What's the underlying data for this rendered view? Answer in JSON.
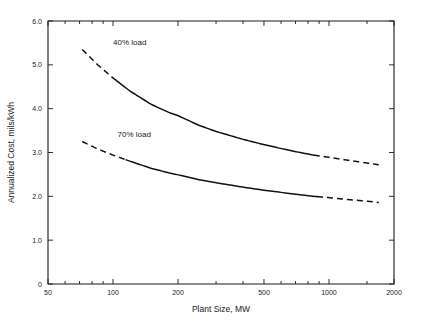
{
  "chart_data": {
    "type": "line",
    "title": "",
    "xlabel": "Plant Size, MW",
    "ylabel": "Annualized Cost, mils/kWh",
    "xscale": "log",
    "yscale": "linear",
    "xlim": [
      50,
      2000
    ],
    "ylim": [
      0,
      6.0
    ],
    "grid": false,
    "legend_position": "inline-annotations",
    "x_tick_labels": [
      "50",
      "100",
      "200",
      "500",
      "1000",
      "2000"
    ],
    "x_tick_values": [
      50,
      100,
      200,
      500,
      1000,
      2000
    ],
    "x_minor_tick_values": [
      60,
      70,
      80,
      90,
      300,
      400,
      600,
      700,
      800,
      900,
      1500
    ],
    "y_tick_labels": [
      "0",
      "1.0",
      "2.0",
      "3.0",
      "4.0",
      "5.0",
      "6.0"
    ],
    "y_tick_values": [
      0,
      1.0,
      2.0,
      3.0,
      4.0,
      5.0,
      6.0
    ],
    "series": [
      {
        "name": "40% load",
        "label": "40% load",
        "x": [
          72,
          85,
          100,
          120,
          150,
          180,
          200,
          250,
          300,
          400,
          500,
          600,
          700,
          850,
          1000,
          1200,
          1500,
          1700
        ],
        "y": [
          5.35,
          5.0,
          4.7,
          4.4,
          4.1,
          3.92,
          3.84,
          3.62,
          3.48,
          3.3,
          3.18,
          3.09,
          3.02,
          2.94,
          2.89,
          2.83,
          2.76,
          2.72
        ],
        "solid_range": [
          100,
          850
        ],
        "dashed_ranges": [
          [
            72,
            100
          ],
          [
            850,
            1700
          ]
        ]
      },
      {
        "name": "70% load",
        "label": "70% load",
        "x": [
          72,
          85,
          100,
          120,
          150,
          180,
          200,
          250,
          300,
          400,
          500,
          600,
          700,
          850,
          1000,
          1200,
          1500,
          1700
        ],
        "y": [
          3.25,
          3.08,
          2.94,
          2.8,
          2.64,
          2.54,
          2.49,
          2.38,
          2.31,
          2.21,
          2.14,
          2.09,
          2.05,
          2.0,
          1.97,
          1.93,
          1.89,
          1.86
        ],
        "solid_range": [
          115,
          880
        ],
        "dashed_ranges": [
          [
            72,
            115
          ],
          [
            880,
            1700
          ]
        ]
      }
    ],
    "annotations": [
      {
        "text": "40% load",
        "x_data": 100,
        "y_data": 5.45
      },
      {
        "text": "70% load",
        "x_data": 105,
        "y_data": 3.35
      }
    ],
    "colors": {
      "curve": "#111111",
      "axis": "#1a1a1a",
      "background": "#ffffff"
    }
  }
}
